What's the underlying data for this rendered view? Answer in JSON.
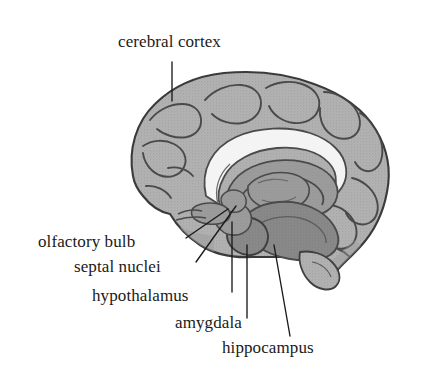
{
  "figure": {
    "kind": "anatomical-diagram",
    "width": 421,
    "height": 376,
    "background_color": "#ffffff"
  },
  "palette": {
    "background": "#ffffff",
    "ink": "#1a1a1a",
    "outline": "#3a3a3a",
    "cortex_fill": "#b2b2b2",
    "cortex_shadow": "#8f8f8f",
    "sulcus_line": "#555555",
    "corpus_callosum": "#f2f2f2",
    "limbic_fill": "#8a8a8a",
    "limbic_dark": "#6f6f6f",
    "leader_line": "#1a1a1a"
  },
  "labels": [
    {
      "id": "cerebral-cortex",
      "text": "cerebral cortex",
      "x": 118,
      "y": 32,
      "align": "left",
      "leader": {
        "x1": 172,
        "y1": 62,
        "x2": 172,
        "y2": 101
      }
    },
    {
      "id": "olfactory-bulb",
      "text": "olfactory bulb",
      "x": 38,
      "y": 232,
      "align": "left",
      "leader": {
        "x1": 186,
        "y1": 238,
        "x2": 228,
        "y2": 209
      }
    },
    {
      "id": "septal-nuclei",
      "text": "septal nuclei",
      "x": 74,
      "y": 257,
      "align": "left",
      "leader": {
        "x1": 196,
        "y1": 262,
        "x2": 236,
        "y2": 206
      }
    },
    {
      "id": "hypothalamus",
      "text": "hypothalamus",
      "x": 92,
      "y": 286,
      "align": "left",
      "leader": {
        "x1": 232,
        "y1": 292,
        "x2": 232,
        "y2": 222
      }
    },
    {
      "id": "amygdala",
      "text": "amygdala",
      "x": 175,
      "y": 313,
      "align": "left",
      "leader": {
        "x1": 247,
        "y1": 318,
        "x2": 247,
        "y2": 245
      }
    },
    {
      "id": "hippocampus",
      "text": "hippocampus",
      "x": 222,
      "y": 338,
      "align": "left",
      "leader": {
        "x1": 290,
        "y1": 336,
        "x2": 274,
        "y2": 245
      }
    }
  ],
  "structures": [
    {
      "id": "cerebral-cortex",
      "name": "cerebral cortex",
      "tone": "light-stipple"
    },
    {
      "id": "corpus-callosum",
      "name": "corpus callosum",
      "tone": "white-band"
    },
    {
      "id": "olfactory-bulb",
      "name": "olfactory bulb",
      "tone": "mid-gray"
    },
    {
      "id": "septal-nuclei",
      "name": "septal nuclei",
      "tone": "mid-gray"
    },
    {
      "id": "hypothalamus",
      "name": "hypothalamus",
      "tone": "mid-gray"
    },
    {
      "id": "amygdala",
      "name": "amygdala",
      "tone": "dark-gray"
    },
    {
      "id": "hippocampus",
      "name": "hippocampus",
      "tone": "dark-gray"
    }
  ]
}
